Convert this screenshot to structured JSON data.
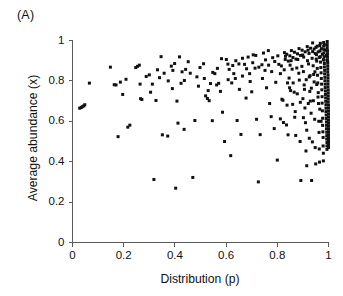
{
  "figure": {
    "panel_label": "(A)",
    "background_color": "#ffffff",
    "marker_color": "#111111",
    "axis_color": "#5a5a5a"
  },
  "chart_data": {
    "type": "scatter",
    "title": "",
    "panel": "(A)",
    "xlabel": "Distribution (p)",
    "ylabel": "Average abundance (x)",
    "xlim": [
      0,
      1
    ],
    "ylim": [
      0,
      1
    ],
    "xticks": [
      0,
      0.2,
      0.4,
      0.6,
      0.8,
      1
    ],
    "yticks": [
      0,
      0.2,
      0.4,
      0.6,
      0.8,
      1
    ],
    "xtick_labels": [
      "0",
      "0.2",
      "0.4",
      "0.6",
      "0.8",
      "1"
    ],
    "ytick_labels": [
      "0",
      "0.2",
      "0.4",
      "0.6",
      "0.8",
      "1"
    ],
    "grid": false,
    "legend": null,
    "marker": "square",
    "marker_size_px": 3,
    "n_points": 312,
    "points": [
      [
        0.028,
        0.665
      ],
      [
        0.034,
        0.668
      ],
      [
        0.038,
        0.672
      ],
      [
        0.044,
        0.676
      ],
      [
        0.048,
        0.682
      ],
      [
        0.066,
        0.789
      ],
      [
        0.148,
        0.868
      ],
      [
        0.163,
        0.781
      ],
      [
        0.17,
        0.78
      ],
      [
        0.178,
        0.524
      ],
      [
        0.187,
        0.794
      ],
      [
        0.196,
        0.733
      ],
      [
        0.209,
        0.808
      ],
      [
        0.216,
        0.571
      ],
      [
        0.224,
        0.581
      ],
      [
        0.247,
        0.866
      ],
      [
        0.254,
        0.872
      ],
      [
        0.261,
        0.878
      ],
      [
        0.266,
        0.712
      ],
      [
        0.271,
        0.708
      ],
      [
        0.3,
        0.83
      ],
      [
        0.312,
        0.784
      ],
      [
        0.318,
        0.312
      ],
      [
        0.326,
        0.703
      ],
      [
        0.332,
        0.855
      ],
      [
        0.34,
        0.816
      ],
      [
        0.346,
        0.92
      ],
      [
        0.351,
        0.533
      ],
      [
        0.372,
        0.527
      ],
      [
        0.386,
        0.873
      ],
      [
        0.392,
        0.852
      ],
      [
        0.399,
        0.886
      ],
      [
        0.403,
        0.269
      ],
      [
        0.412,
        0.591
      ],
      [
        0.418,
        0.919
      ],
      [
        0.428,
        0.845
      ],
      [
        0.436,
        0.56
      ],
      [
        0.442,
        0.857
      ],
      [
        0.452,
        0.895
      ],
      [
        0.47,
        0.322
      ],
      [
        0.478,
        0.604
      ],
      [
        0.486,
        0.82
      ],
      [
        0.492,
        0.774
      ],
      [
        0.512,
        0.885
      ],
      [
        0.52,
        0.726
      ],
      [
        0.527,
        0.713
      ],
      [
        0.534,
        0.702
      ],
      [
        0.539,
        0.787
      ],
      [
        0.546,
        0.603
      ],
      [
        0.556,
        0.836
      ],
      [
        0.563,
        0.78
      ],
      [
        0.571,
        0.788
      ],
      [
        0.578,
        0.748
      ],
      [
        0.586,
        0.645
      ],
      [
        0.594,
        0.5
      ],
      [
        0.601,
        0.906
      ],
      [
        0.607,
        0.883
      ],
      [
        0.612,
        0.857
      ],
      [
        0.618,
        0.43
      ],
      [
        0.626,
        0.876
      ],
      [
        0.63,
        0.836
      ],
      [
        0.638,
        0.9
      ],
      [
        0.643,
        0.604
      ],
      [
        0.652,
        0.758
      ],
      [
        0.658,
        0.535
      ],
      [
        0.664,
        0.824
      ],
      [
        0.672,
        0.882
      ],
      [
        0.678,
        0.715
      ],
      [
        0.686,
        0.918
      ],
      [
        0.694,
        0.797
      ],
      [
        0.7,
        0.746
      ],
      [
        0.706,
        0.929
      ],
      [
        0.713,
        0.863
      ],
      [
        0.719,
        0.61
      ],
      [
        0.726,
        0.3
      ],
      [
        0.733,
        0.534
      ],
      [
        0.74,
        0.88
      ],
      [
        0.746,
        0.938
      ],
      [
        0.752,
        0.852
      ],
      [
        0.758,
        0.766
      ],
      [
        0.765,
        0.95
      ],
      [
        0.77,
        0.688
      ],
      [
        0.776,
        0.623
      ],
      [
        0.782,
        0.915
      ],
      [
        0.788,
        0.564
      ],
      [
        0.794,
        0.793
      ],
      [
        0.8,
        0.408
      ],
      [
        0.806,
        0.882
      ],
      [
        0.812,
        0.836
      ],
      [
        0.818,
        0.709
      ],
      [
        0.822,
        0.704
      ],
      [
        0.827,
        0.855
      ],
      [
        0.832,
        0.922
      ],
      [
        0.838,
        0.68
      ],
      [
        0.842,
        0.533
      ],
      [
        0.846,
        0.814
      ],
      [
        0.85,
        0.878
      ],
      [
        0.854,
        0.9
      ],
      [
        0.858,
        0.858
      ],
      [
        0.862,
        0.79
      ],
      [
        0.866,
        0.744
      ],
      [
        0.868,
        0.62
      ],
      [
        0.872,
        0.53
      ],
      [
        0.876,
        0.864
      ],
      [
        0.88,
        0.906
      ],
      [
        0.884,
        0.838
      ],
      [
        0.886,
        0.804
      ],
      [
        0.889,
        0.5
      ],
      [
        0.892,
        0.307
      ],
      [
        0.896,
        0.872
      ],
      [
        0.899,
        0.928
      ],
      [
        0.902,
        0.846
      ],
      [
        0.905,
        0.78
      ],
      [
        0.908,
        0.666
      ],
      [
        0.91,
        0.593
      ],
      [
        0.912,
        0.453
      ],
      [
        0.915,
        0.38
      ],
      [
        0.918,
        0.9
      ],
      [
        0.92,
        0.952
      ],
      [
        0.922,
        0.884
      ],
      [
        0.925,
        0.82
      ],
      [
        0.927,
        0.748
      ],
      [
        0.929,
        0.7
      ],
      [
        0.932,
        0.64
      ],
      [
        0.934,
        0.307
      ],
      [
        0.936,
        0.912
      ],
      [
        0.938,
        0.945
      ],
      [
        0.94,
        0.875
      ],
      [
        0.942,
        0.832
      ],
      [
        0.944,
        0.795
      ],
      [
        0.946,
        0.61
      ],
      [
        0.948,
        0.47
      ],
      [
        0.95,
        0.389
      ],
      [
        0.951,
        0.966
      ],
      [
        0.953,
        0.93
      ],
      [
        0.954,
        0.898
      ],
      [
        0.956,
        0.862
      ],
      [
        0.957,
        0.828
      ],
      [
        0.958,
        0.79
      ],
      [
        0.96,
        0.742
      ],
      [
        0.961,
        0.688
      ],
      [
        0.962,
        0.6
      ],
      [
        0.963,
        0.545
      ],
      [
        0.964,
        0.463
      ],
      [
        0.965,
        0.398
      ],
      [
        0.966,
        0.975
      ],
      [
        0.967,
        0.948
      ],
      [
        0.968,
        0.92
      ],
      [
        0.969,
        0.893
      ],
      [
        0.97,
        0.866
      ],
      [
        0.971,
        0.84
      ],
      [
        0.972,
        0.812
      ],
      [
        0.973,
        0.784
      ],
      [
        0.974,
        0.756
      ],
      [
        0.975,
        0.722
      ],
      [
        0.975,
        0.69
      ],
      [
        0.976,
        0.652
      ],
      [
        0.977,
        0.615
      ],
      [
        0.977,
        0.58
      ],
      [
        0.978,
        0.548
      ],
      [
        0.979,
        0.52
      ],
      [
        0.979,
        0.478
      ],
      [
        0.98,
        0.442
      ],
      [
        0.98,
        0.404
      ],
      [
        0.981,
        0.99
      ],
      [
        0.981,
        0.972
      ],
      [
        0.982,
        0.955
      ],
      [
        0.982,
        0.938
      ],
      [
        0.983,
        0.92
      ],
      [
        0.983,
        0.903
      ],
      [
        0.984,
        0.886
      ],
      [
        0.984,
        0.869
      ],
      [
        0.985,
        0.852
      ],
      [
        0.985,
        0.835
      ],
      [
        0.986,
        0.818
      ],
      [
        0.986,
        0.801
      ],
      [
        0.987,
        0.784
      ],
      [
        0.987,
        0.767
      ],
      [
        0.988,
        0.75
      ],
      [
        0.988,
        0.733
      ],
      [
        0.989,
        0.716
      ],
      [
        0.989,
        0.699
      ],
      [
        0.99,
        0.682
      ],
      [
        0.99,
        0.665
      ],
      [
        0.99,
        0.648
      ],
      [
        0.991,
        0.631
      ],
      [
        0.991,
        0.614
      ],
      [
        0.992,
        0.597
      ],
      [
        0.992,
        0.58
      ],
      [
        0.992,
        0.563
      ],
      [
        0.993,
        0.546
      ],
      [
        0.993,
        0.529
      ],
      [
        0.993,
        0.512
      ],
      [
        0.994,
        0.495
      ],
      [
        0.994,
        0.478
      ],
      [
        0.994,
        0.461
      ],
      [
        0.995,
        0.995
      ],
      [
        0.995,
        0.98
      ],
      [
        0.995,
        0.965
      ],
      [
        0.996,
        0.95
      ],
      [
        0.996,
        0.935
      ],
      [
        0.996,
        0.92
      ],
      [
        0.996,
        0.905
      ],
      [
        0.997,
        0.89
      ],
      [
        0.997,
        0.875
      ],
      [
        0.997,
        0.86
      ],
      [
        0.997,
        0.845
      ],
      [
        0.998,
        0.83
      ],
      [
        0.998,
        0.815
      ],
      [
        0.998,
        0.8
      ],
      [
        0.998,
        0.785
      ],
      [
        0.998,
        0.77
      ],
      [
        0.999,
        0.755
      ],
      [
        0.999,
        0.74
      ],
      [
        0.999,
        0.725
      ],
      [
        0.999,
        0.71
      ],
      [
        0.999,
        0.695
      ],
      [
        1.0,
        0.68
      ],
      [
        1.0,
        0.665
      ],
      [
        1.0,
        0.65
      ],
      [
        1.0,
        0.635
      ],
      [
        1.0,
        0.62
      ],
      [
        1.0,
        0.605
      ],
      [
        1.0,
        0.59
      ],
      [
        1.0,
        0.575
      ],
      [
        1.0,
        0.56
      ],
      [
        1.0,
        0.545
      ],
      [
        1.0,
        0.53
      ],
      [
        1.0,
        0.515
      ],
      [
        1.0,
        0.5
      ],
      [
        1.0,
        0.485
      ],
      [
        1.0,
        0.47
      ],
      [
        0.944,
        0.958
      ],
      [
        0.948,
        0.936
      ],
      [
        0.952,
        0.908
      ],
      [
        0.956,
        0.972
      ],
      [
        0.96,
        0.944
      ],
      [
        0.964,
        0.916
      ],
      [
        0.968,
        0.986
      ],
      [
        0.972,
        0.96
      ],
      [
        0.976,
        0.932
      ],
      [
        0.98,
        0.905
      ],
      [
        0.984,
        0.978
      ],
      [
        0.988,
        0.952
      ],
      [
        0.992,
        0.926
      ],
      [
        0.996,
        0.9
      ],
      [
        0.938,
        0.988
      ],
      [
        0.93,
        0.962
      ],
      [
        0.924,
        0.936
      ],
      [
        0.917,
        0.97
      ],
      [
        0.909,
        0.944
      ],
      [
        0.903,
        0.918
      ],
      [
        0.897,
        0.952
      ],
      [
        0.891,
        0.926
      ],
      [
        0.885,
        0.96
      ],
      [
        0.879,
        0.934
      ],
      [
        0.873,
        0.908
      ],
      [
        0.867,
        0.942
      ],
      [
        0.861,
        0.916
      ],
      [
        0.855,
        0.95
      ],
      [
        0.849,
        0.924
      ],
      [
        0.843,
        0.898
      ],
      [
        0.837,
        0.932
      ],
      [
        0.831,
        0.906
      ],
      [
        0.9,
        0.712
      ],
      [
        0.906,
        0.758
      ],
      [
        0.913,
        0.806
      ],
      [
        0.921,
        0.688
      ],
      [
        0.928,
        0.826
      ],
      [
        0.933,
        0.764
      ],
      [
        0.941,
        0.702
      ],
      [
        0.947,
        0.845
      ],
      [
        0.954,
        0.782
      ],
      [
        0.959,
        0.72
      ],
      [
        0.966,
        0.66
      ],
      [
        0.971,
        0.6
      ],
      [
        0.812,
        0.612
      ],
      [
        0.824,
        0.594
      ],
      [
        0.836,
        0.582
      ],
      [
        0.848,
        0.766
      ],
      [
        0.86,
        0.684
      ],
      [
        0.87,
        0.648
      ],
      [
        0.878,
        0.736
      ],
      [
        0.89,
        0.694
      ],
      [
        0.902,
        0.618
      ],
      [
        0.915,
        0.556
      ],
      [
        0.925,
        0.516
      ],
      [
        0.937,
        0.498
      ],
      [
        0.608,
        0.806
      ],
      [
        0.622,
        0.79
      ],
      [
        0.636,
        0.812
      ],
      [
        0.65,
        0.884
      ],
      [
        0.664,
        0.912
      ],
      [
        0.68,
        0.86
      ],
      [
        0.692,
        0.836
      ],
      [
        0.704,
        0.89
      ],
      [
        0.716,
        0.926
      ],
      [
        0.728,
        0.868
      ],
      [
        0.742,
        0.812
      ],
      [
        0.754,
        0.904
      ],
      [
        0.766,
        0.878
      ],
      [
        0.778,
        0.846
      ],
      [
        0.79,
        0.896
      ],
      [
        0.802,
        0.924
      ],
      [
        0.816,
        0.874
      ],
      [
        0.828,
        0.94
      ],
      [
        0.84,
        0.79
      ],
      [
        0.852,
        0.752
      ],
      [
        0.437,
        0.802
      ],
      [
        0.46,
        0.838
      ],
      [
        0.498,
        0.866
      ],
      [
        0.515,
        0.812
      ],
      [
        0.53,
        0.752
      ],
      [
        0.548,
        0.842
      ],
      [
        0.566,
        0.862
      ],
      [
        0.582,
        0.91
      ],
      [
        0.264,
        0.784
      ],
      [
        0.288,
        0.822
      ],
      [
        0.305,
        0.744
      ],
      [
        0.358,
        0.838
      ],
      [
        0.374,
        0.8
      ],
      [
        0.39,
        0.762
      ],
      [
        0.408,
        0.7
      ],
      [
        0.424,
        0.788
      ]
    ]
  },
  "axes": {
    "x_title": "Distribution (p)",
    "y_title": "Average abundance (x)",
    "x_labels": [
      "0",
      "0.2",
      "0.4",
      "0.6",
      "0.8",
      "1"
    ],
    "y_labels": [
      "1",
      "0.8",
      "0.6",
      "0.4",
      "0.2",
      "0"
    ]
  }
}
